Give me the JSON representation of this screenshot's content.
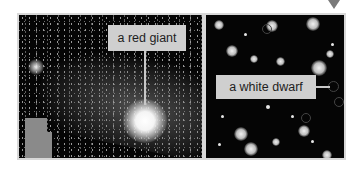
{
  "panels": {
    "left": {
      "label": "a red giant"
    },
    "right": {
      "label": "a white dwarf"
    }
  },
  "colors": {
    "background": "#ffffff",
    "sky": "#050505",
    "label_bg": "#cfcfcf",
    "label_text": "#1e1e1e",
    "arrow": "#7a7a7a"
  }
}
